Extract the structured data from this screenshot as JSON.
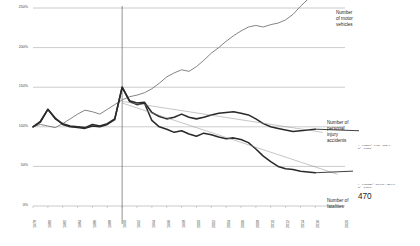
{
  "chart_data": {
    "type": "line",
    "title": "",
    "xlabel": "",
    "ylabel": "",
    "index_base": "100% = 1978",
    "grid": true,
    "legend_position": "right-inline-annotations",
    "xlim": [
      1978,
      2020
    ],
    "ylim": [
      0,
      250
    ],
    "yticks": [
      "0%",
      "50%",
      "100%",
      "150%",
      "200%",
      "250%"
    ],
    "ytick_values": [
      0,
      50,
      100,
      150,
      200,
      250
    ],
    "xticks": [
      "1978",
      "1980",
      "1982",
      "1984",
      "1986",
      "1988",
      "1990",
      "1992",
      "1994",
      "1996",
      "1998",
      "2000",
      "2002",
      "2004",
      "2006",
      "2008",
      "2010",
      "2012",
      "2014",
      "2016",
      "2020"
    ],
    "x": [
      1978,
      1979,
      1980,
      1981,
      1982,
      1983,
      1984,
      1985,
      1986,
      1987,
      1988,
      1989,
      1990,
      1991,
      1992,
      1993,
      1994,
      1995,
      1996,
      1997,
      1998,
      1999,
      2000,
      2001,
      2002,
      2003,
      2004,
      2005,
      2006,
      2007,
      2008,
      2009,
      2010,
      2011,
      2012,
      2013,
      2014,
      2015,
      2016
    ],
    "reference_line_year": 1990,
    "series": [
      {
        "name": "Number of motor vehicles",
        "style": "thin-gray",
        "values": [
          100,
          103,
          101,
          99,
          104,
          110,
          116,
          121,
          119,
          116,
          122,
          128,
          134,
          138,
          140,
          143,
          148,
          155,
          163,
          168,
          172,
          170,
          176,
          184,
          193,
          200,
          208,
          215,
          221,
          226,
          228,
          226,
          229,
          231,
          235,
          242,
          252,
          261,
          270
        ]
      },
      {
        "name": "Number of personal injury accidents",
        "style": "thick-dark",
        "values": [
          100,
          107,
          122,
          110,
          104,
          101,
          100,
          99,
          103,
          101,
          104,
          110,
          150,
          133,
          130,
          131,
          118,
          113,
          110,
          112,
          116,
          112,
          110,
          112,
          115,
          117,
          118,
          119,
          117,
          115,
          110,
          104,
          100,
          98,
          96,
          94,
          95,
          96,
          97
        ]
      },
      {
        "name": "Number of fatalities",
        "style": "thick-dark",
        "values": [
          100,
          106,
          122,
          111,
          103,
          100,
          99,
          98,
          101,
          100,
          103,
          109,
          150,
          132,
          128,
          130,
          108,
          100,
          97,
          93,
          95,
          91,
          88,
          92,
          90,
          87,
          85,
          86,
          84,
          80,
          72,
          63,
          56,
          50,
          47,
          46,
          44,
          43,
          42
        ]
      }
    ],
    "trendlines": [
      {
        "for": "Number of personal injury accidents",
        "equation": "y = 0.0266x² - 1.03x - 1789.0",
        "r2": "R² = 1.0873"
      },
      {
        "for": "Number of fatalities",
        "equation": "y = 0.00082x² - 3.5447x + 2544.0",
        "r2": "R² = 3.3793"
      }
    ],
    "annotations": [
      {
        "name": "motor-vehicles",
        "text": "Number\nof motor\nvehicles"
      },
      {
        "name": "injury-accidents",
        "text": "Number of\npersonal\ninjury\naccidents"
      },
      {
        "name": "fatalities",
        "text": "Number of\nfatalities"
      }
    ],
    "data_labels": [
      {
        "name": "fatalities-endpoint",
        "value": "470"
      }
    ],
    "colors": {
      "grid": "#9aa0a6",
      "series_thin": "#6e6e6e",
      "series_thick": "#2a2a2a",
      "trendline": "#8d8d8d",
      "text": "#1f1f1f"
    }
  }
}
